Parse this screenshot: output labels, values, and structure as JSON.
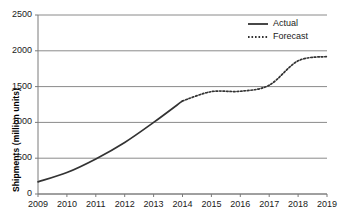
{
  "chart_data": {
    "type": "line",
    "title": "",
    "xlabel": "",
    "ylabel": "Shipments  (million units)",
    "x": [
      2009,
      2010,
      2011,
      2012,
      2013,
      2014,
      2015,
      2016,
      2017,
      2018,
      2019
    ],
    "categories": [
      "2009",
      "2010",
      "2011",
      "2012",
      "2013",
      "2014",
      "2015",
      "2016",
      "2017",
      "2018",
      "2019"
    ],
    "xlim": [
      2009,
      2019
    ],
    "ylim": [
      0,
      2500
    ],
    "yticks": [
      0,
      500,
      1000,
      1500,
      2000,
      2500
    ],
    "ytick_labels": [
      "0",
      "500",
      "1000",
      "1500",
      "2000",
      "2500"
    ],
    "grid": true,
    "grid_axis": "y",
    "legend_position": "top-right",
    "series": [
      {
        "name": "Actual",
        "style": "solid",
        "color": "#333333",
        "x": [
          2009,
          2010,
          2011,
          2012,
          2013,
          2014
        ],
        "values": [
          170,
          300,
          490,
          720,
          1000,
          1300
        ]
      },
      {
        "name": "Forecast",
        "style": "dotted",
        "color": "#333333",
        "x": [
          2014,
          2015,
          2016,
          2017,
          2018,
          2019
        ],
        "values": [
          1300,
          1430,
          1435,
          1520,
          1860,
          1920
        ]
      }
    ]
  },
  "legend": {
    "items": [
      {
        "label": "Actual",
        "style": "solid"
      },
      {
        "label": "Forecast",
        "style": "dotted"
      }
    ]
  }
}
